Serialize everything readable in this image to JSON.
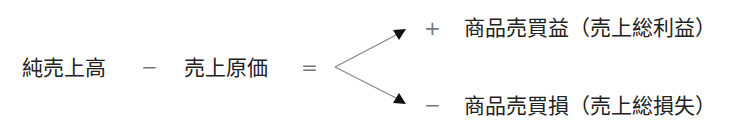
{
  "equation": {
    "term1": "純売上高",
    "minus": "−",
    "term2": "売上原価",
    "equals": "="
  },
  "outcomes": [
    {
      "sign": "+",
      "label": "商品売買益（売上総利益）"
    },
    {
      "sign": "−",
      "label": "商品売買損（売上総損失）"
    }
  ],
  "colors": {
    "text": "#222222",
    "operator": "#777777",
    "arrow": "#888888",
    "arrowhead": "#111111"
  }
}
